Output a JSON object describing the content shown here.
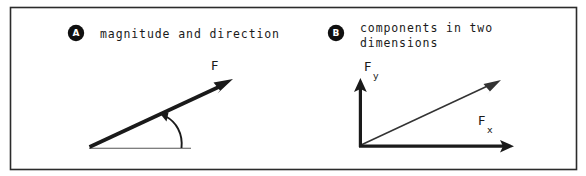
{
  "figure": {
    "background_color": "#ffffff",
    "ink_color": "#1a1a1a",
    "border_color": "#2b2b2b",
    "width": 586,
    "height": 176
  },
  "panels": [
    {
      "id": "panel-a",
      "badge": "A",
      "caption_lines": [
        "magnitude and direction"
      ],
      "vector_label": "F",
      "diagram": {
        "type": "single-vector-with-angle",
        "vector_start": [
          89,
          147
        ],
        "vector_tip": [
          233,
          80
        ],
        "baseline_start": [
          89,
          148
        ],
        "baseline_end": [
          191,
          148
        ],
        "angle_arc": "from baseline up to vector"
      }
    },
    {
      "id": "panel-b",
      "badge": "B",
      "caption_lines": [
        "components in two",
        "dimensions"
      ],
      "axis_x_label": "F",
      "axis_x_sub": "x",
      "axis_y_label": "F",
      "axis_y_sub": "y",
      "diagram": {
        "type": "two-component-axes-with-resultant",
        "origin": [
          360,
          146
        ],
        "x_axis_tip": [
          513,
          146
        ],
        "y_axis_tip": [
          360,
          79
        ],
        "resultant_tip": [
          501,
          81
        ]
      }
    }
  ]
}
